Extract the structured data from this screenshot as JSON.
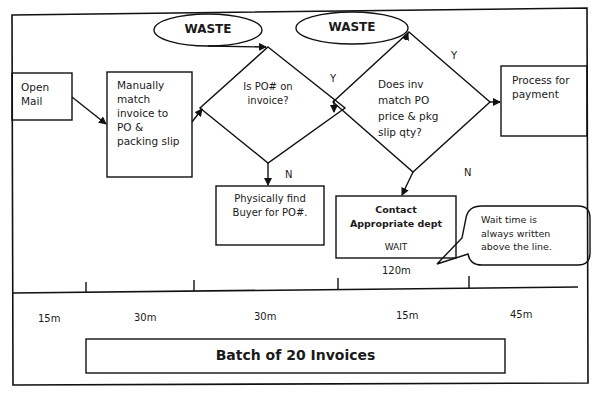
{
  "diagram": {
    "type": "value-stream-flowchart",
    "waste_labels": [
      "WASTE",
      "WASTE"
    ],
    "nodes": {
      "open_mail": "Open\nMail",
      "manual_match": "Manually\nmatch\ninvoice to\nPO &\npacking slip",
      "decision_po": "Is PO# on\ninvoice?",
      "decision_match": "Does inv\nmatch PO\nprice & pkg\nslip qty?",
      "process_payment": "Process for\npayment",
      "find_buyer": "Physically find\nBuyer for PO#.",
      "contact_dept": "Contact\nAppropriate dept",
      "contact_wait": "WAIT"
    },
    "edge_labels": {
      "po_yes": "Y",
      "po_no": "N",
      "match_yes": "Y",
      "match_no": "N"
    },
    "callout": "Wait time is\nalways written\nabove the line.",
    "timeline": {
      "wait_above": "120m",
      "process_times": [
        "15m",
        "30m",
        "30m",
        "15m",
        "45m"
      ]
    },
    "batch_label": "Batch of 20 Invoices"
  }
}
